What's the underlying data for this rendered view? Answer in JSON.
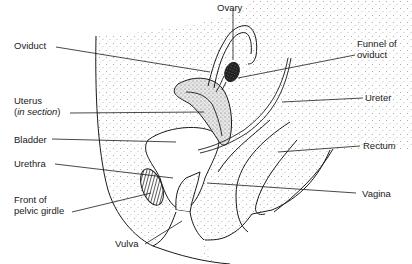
{
  "diagram": {
    "colors": {
      "ink": "#1a1a1a",
      "background": "#ffffff",
      "stipple": "#555555"
    },
    "labels": {
      "ovary": "Ovary",
      "oviduct": "Oviduct",
      "funnel_line1": "Funnel of",
      "funnel_line2": "oviduct",
      "uterus_line1": "Uterus",
      "uterus_open": "(",
      "uterus_italic": "in section",
      "uterus_close": ")",
      "ureter": "Ureter",
      "bladder": "Bladder",
      "rectum": "Rectum",
      "urethra": "Urethra",
      "vagina": "Vagina",
      "pelvic_line1": "Front of",
      "pelvic_line2": "pelvic girdle",
      "vulva": "Vulva"
    }
  }
}
